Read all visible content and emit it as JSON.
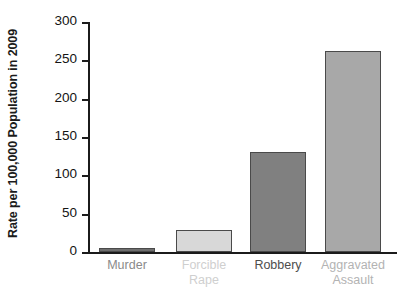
{
  "chart_data": {
    "type": "bar",
    "title": "",
    "subtitle": "",
    "xlabel": "",
    "ylabel": "Rate per 100,000 Population in 2009",
    "categories": [
      "Murder",
      "Forcible Rape",
      "Robbery",
      "Aggravated Assault"
    ],
    "values": [
      5,
      28.5,
      131,
      262
    ],
    "ylim": [
      0,
      300
    ],
    "y_ticks": [
      0,
      50,
      100,
      150,
      200,
      250,
      300
    ],
    "y_tick_labels": [
      "0",
      "50",
      "100",
      "150",
      "200",
      "250",
      "300"
    ],
    "grid": false,
    "legend": "none",
    "bar_colors": [
      "#6e6e6e",
      "#d8d8d8",
      "#808080",
      "#a8a8a8"
    ],
    "bar_border_color": "#4a4a4a",
    "category_label_colors": [
      "#8a8a8a",
      "#cfcfcf",
      "#4d4d4d",
      "#b3b3b3"
    ],
    "axis_color": "#1b1b1b"
  },
  "axis": {
    "y_title": "Rate per 100,000 Population in 2009"
  },
  "categories": [
    {
      "label": "Murder"
    },
    {
      "label": "Forcible\nRape"
    },
    {
      "label": "Robbery"
    },
    {
      "label": "Aggravated\nAssault"
    }
  ],
  "ticks": [
    {
      "label": "300"
    },
    {
      "label": "250"
    },
    {
      "label": "200"
    },
    {
      "label": "150"
    },
    {
      "label": "100"
    },
    {
      "label": "50"
    },
    {
      "label": "0"
    }
  ]
}
